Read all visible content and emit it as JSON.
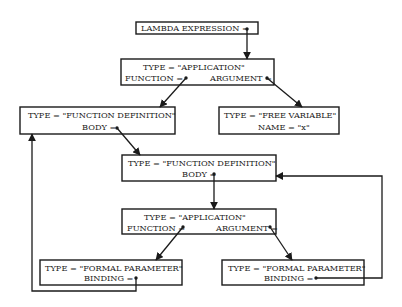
{
  "diagram": {
    "nodes": [
      {
        "id": "lambda",
        "lines": [
          "LAMBDA EXPRESSION ="
        ],
        "box": [
          136,
          22,
          122,
          12
        ]
      },
      {
        "id": "app1",
        "lines": [
          "TYPE = \"APPLICATION\"",
          "FUNCTION =",
          "ARGUMENT ="
        ],
        "box": [
          121,
          59,
          153,
          26
        ]
      },
      {
        "id": "fundef1",
        "lines": [
          "TYPE = \"FUNCTION DEFINITION\"",
          "BODY ="
        ],
        "box": [
          20,
          107,
          155,
          27
        ]
      },
      {
        "id": "freevar",
        "lines": [
          "TYPE = \"FREE VARIABLE\"",
          "NAME = \"x\""
        ],
        "box": [
          219,
          107,
          120,
          27
        ]
      },
      {
        "id": "fundef2",
        "lines": [
          "TYPE = \"FUNCTION DEFINITION\"",
          "BODY ="
        ],
        "box": [
          122,
          155,
          154,
          26
        ]
      },
      {
        "id": "app2",
        "lines": [
          "TYPE = \"APPLICATION\"",
          "FUNCTION =",
          "ARGUMENT ="
        ],
        "box": [
          122,
          209,
          154,
          25
        ]
      },
      {
        "id": "formal1",
        "lines": [
          "TYPE = \"FORMAL PARAMETER\"",
          "BINDING ="
        ],
        "box": [
          40,
          260,
          142,
          25
        ]
      },
      {
        "id": "formal2",
        "lines": [
          "TYPE = \"FORMAL PARAMETER\"",
          "BINDING ="
        ],
        "box": [
          222,
          260,
          142,
          25
        ]
      }
    ],
    "edges": [
      {
        "from": "lambda",
        "to": "app1"
      },
      {
        "from": "app1.function",
        "to": "fundef1"
      },
      {
        "from": "app1.argument",
        "to": "freevar"
      },
      {
        "from": "fundef1.body",
        "to": "fundef2"
      },
      {
        "from": "fundef2.body",
        "to": "app2"
      },
      {
        "from": "app2.function",
        "to": "formal1"
      },
      {
        "from": "app2.argument",
        "to": "formal2"
      },
      {
        "from": "formal1.binding",
        "to": "fundef1"
      },
      {
        "from": "formal2.binding",
        "to": "fundef2"
      }
    ],
    "colors": {
      "ink": "#1a1a1a",
      "paper": "#ffffff"
    }
  }
}
